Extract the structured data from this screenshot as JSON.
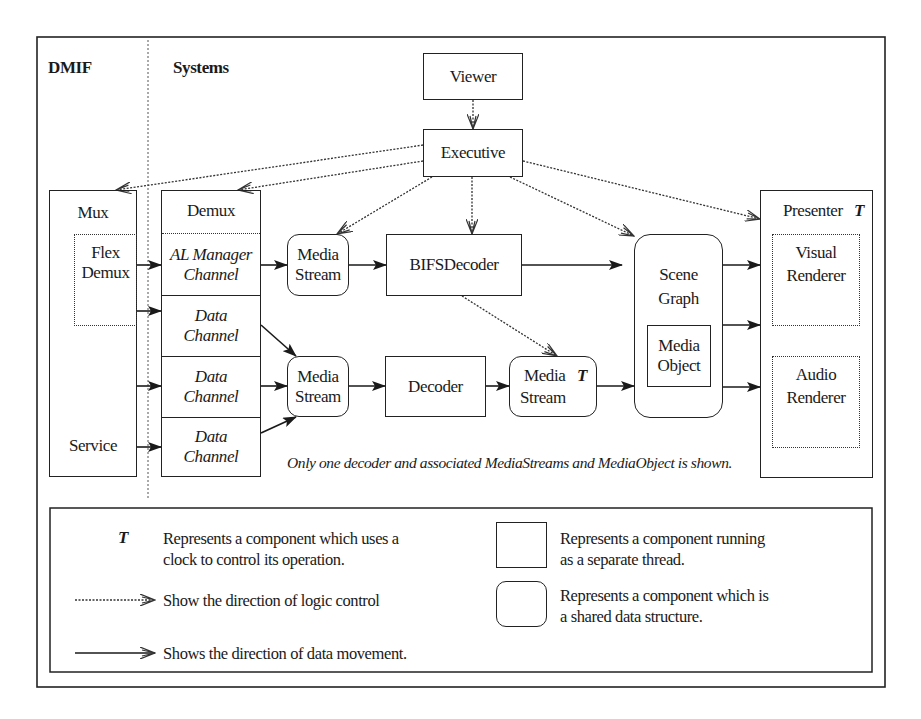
{
  "diagram": {
    "regions": {
      "dmif": "DMIF",
      "systems": "Systems"
    },
    "components": {
      "viewer": "Viewer",
      "executive": "Executive",
      "mux": "Mux",
      "flex_demux_line1": "Flex",
      "flex_demux_line2": "Demux",
      "service": "Service",
      "demux": "Demux",
      "al_manager_line1": "AL Manager",
      "al_manager_line2": "Channel",
      "data_channels": [
        {
          "line1": "Data",
          "line2": "Channel"
        },
        {
          "line1": "Data",
          "line2": "Channel"
        },
        {
          "line1": "Data",
          "line2": "Channel"
        }
      ],
      "media_stream_1": {
        "line1": "Media",
        "line2": "Stream"
      },
      "media_stream_2": {
        "line1": "Media",
        "line2": "Stream"
      },
      "media_stream_3": {
        "line1": "Media",
        "line2": "Stream",
        "clock_marker": "T"
      },
      "bifs_decoder": "BIFSDecoder",
      "decoder": "Decoder",
      "scene_graph_line1": "Scene",
      "scene_graph_line2": "Graph",
      "media_object_line1": "Media",
      "media_object_line2": "Object",
      "presenter": "Presenter",
      "presenter_clock_marker": "T",
      "visual_renderer_line1": "Visual",
      "visual_renderer_line2": "Renderer",
      "audio_renderer_line1": "Audio",
      "audio_renderer_line2": "Renderer"
    },
    "note": "Only one decoder and associated MediaStreams and MediaObject is shown.",
    "edges": {
      "logic_control": [
        {
          "from": "Viewer",
          "to": "Executive"
        },
        {
          "from": "Executive",
          "to": "Mux"
        },
        {
          "from": "Executive",
          "to": "Demux"
        },
        {
          "from": "Executive",
          "to": "Media Stream"
        },
        {
          "from": "Executive",
          "to": "BIFSDecoder"
        },
        {
          "from": "Executive",
          "to": "Scene Graph"
        },
        {
          "from": "Executive",
          "to": "Presenter"
        },
        {
          "from": "BIFSDecoder",
          "to": "Media Stream (T)"
        }
      ],
      "data_movement": [
        {
          "from": "Flex Demux",
          "to": "AL Manager Channel"
        },
        {
          "from": "Flex Demux",
          "to": "Data Channel 1"
        },
        {
          "from": "Mux",
          "to": "Data Channel 2"
        },
        {
          "from": "Service",
          "to": "Data Channel 3"
        },
        {
          "from": "AL Manager Channel",
          "to": "Media Stream 1"
        },
        {
          "from": "Media Stream 1",
          "to": "BIFSDecoder"
        },
        {
          "from": "BIFSDecoder",
          "to": "Scene Graph"
        },
        {
          "from": "Data Channel 1",
          "to": "Media Stream 2"
        },
        {
          "from": "Data Channel 2",
          "to": "Media Stream 2"
        },
        {
          "from": "Data Channel 3",
          "to": "Media Stream 2"
        },
        {
          "from": "Media Stream 2",
          "to": "Decoder"
        },
        {
          "from": "Decoder",
          "to": "Media Stream (T)"
        },
        {
          "from": "Media Stream (T)",
          "to": "Scene Graph"
        },
        {
          "from": "Scene Graph",
          "to": "Visual Renderer"
        },
        {
          "from": "Scene Graph",
          "to": "Presenter"
        },
        {
          "from": "Scene Graph",
          "to": "Audio Renderer"
        }
      ]
    }
  },
  "legend": {
    "clock_symbol": "T",
    "clock_desc_line1": "Represents a component which uses a",
    "clock_desc_line2": "clock to control its operation.",
    "logic_control_desc": "Show the direction of logic control",
    "data_movement_desc": "Shows the direction of data movement.",
    "thread_desc_line1": "Represents a component running",
    "thread_desc_line2": "as a separate thread.",
    "shared_desc_line1": "Represents a component which is",
    "shared_desc_line2": "a shared data structure."
  },
  "colors": {
    "stroke": "#222222",
    "background": "#ffffff"
  }
}
